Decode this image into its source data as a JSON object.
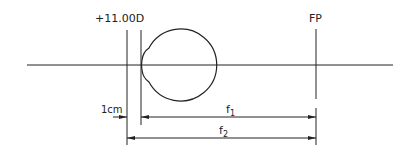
{
  "diagram": {
    "lens_label": "+11.00D",
    "far_point_label": "FP",
    "distance_label": "1cm",
    "f1_label": "f",
    "f1_sub": "1",
    "f2_label": "f",
    "f2_sub": "2"
  },
  "colors": {
    "line": "#222222",
    "background": "#ffffff"
  }
}
